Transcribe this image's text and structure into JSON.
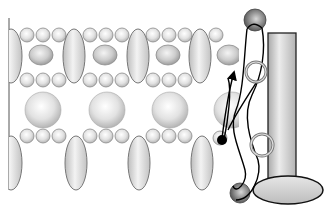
{
  "diagram": {
    "title": "",
    "colors": {
      "background": "#ffffff",
      "sphere_light": "#f2f2f2",
      "sphere_mid": "#cfcfcf",
      "sphere_edge": "#8a8a8a",
      "dark_sphere": "#6b6b6b",
      "line": "#000000",
      "rod_fill": "#d0d0d0"
    },
    "lattice": {
      "left_border_x": 9,
      "columns_x": [
        75,
        137,
        200
      ],
      "small_row_y": [
        35,
        80,
        136
      ],
      "small_circle_r": 7,
      "medium_circle_y": 55,
      "medium_circle_rx": 12,
      "medium_circle_ry": 10,
      "large_circle_y": 110,
      "large_circle_r": 18,
      "upper_ellipse_y": 56,
      "upper_ellipse_rx": 11,
      "upper_ellipse_ry": 27,
      "lower_ellipse_y": 163,
      "lower_ellipse_rx": 11,
      "lower_ellipse_ry": 27
    },
    "rod": {
      "x": 268,
      "y": 33,
      "width": 28,
      "height": 150,
      "base": {
        "cx": 288,
        "cy": 190,
        "rx": 35,
        "ry": 14
      }
    },
    "top_sphere": {
      "cx": 255,
      "cy": 20,
      "r": 11
    },
    "bottom_sphere": {
      "cx": 240,
      "cy": 193,
      "r": 10
    },
    "rings": [
      {
        "cx": 256,
        "cy": 72,
        "r": 10
      },
      {
        "cx": 262,
        "cy": 145,
        "r": 11
      }
    ],
    "dot": {
      "cx": 222,
      "cy": 140,
      "r": 5
    },
    "arrow": {
      "label": ""
    }
  }
}
